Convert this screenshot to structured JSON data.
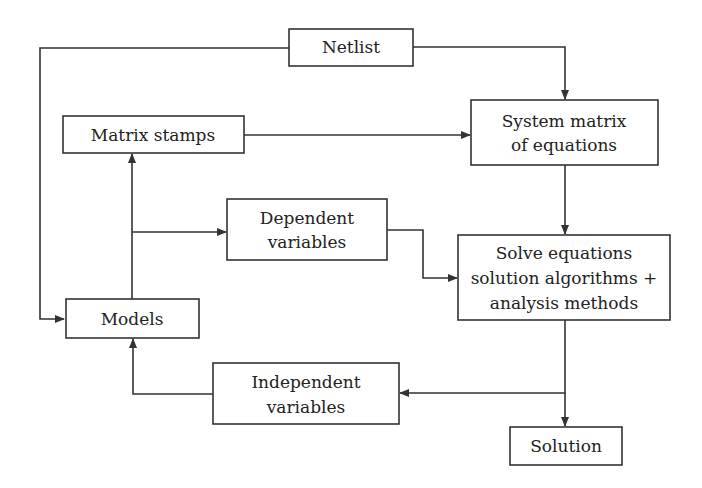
{
  "diagram": {
    "nodes": [
      {
        "id": "netlist",
        "lines": [
          "Netlist"
        ]
      },
      {
        "id": "matrix-stamps",
        "lines": [
          "Matrix stamps"
        ]
      },
      {
        "id": "system-matrix",
        "lines": [
          "System matrix",
          "of equations"
        ]
      },
      {
        "id": "dependent-variables",
        "lines": [
          "Dependent",
          "variables"
        ]
      },
      {
        "id": "solve-equations",
        "lines": [
          "Solve equations",
          "solution algorithms +",
          "analysis methods"
        ]
      },
      {
        "id": "models",
        "lines": [
          "Models"
        ]
      },
      {
        "id": "independent-variables",
        "lines": [
          "Independent",
          "variables"
        ]
      },
      {
        "id": "solution",
        "lines": [
          "Solution"
        ]
      }
    ],
    "edges": [
      {
        "from": "netlist",
        "to": "models"
      },
      {
        "from": "netlist",
        "to": "system-matrix"
      },
      {
        "from": "matrix-stamps",
        "to": "system-matrix"
      },
      {
        "from": "system-matrix",
        "to": "solve-equations"
      },
      {
        "from": "models",
        "to": "matrix-stamps"
      },
      {
        "from": "models",
        "to": "dependent-variables"
      },
      {
        "from": "dependent-variables",
        "to": "solve-equations"
      },
      {
        "from": "solve-equations",
        "to": "independent-variables"
      },
      {
        "from": "solve-equations",
        "to": "solution"
      },
      {
        "from": "independent-variables",
        "to": "models"
      }
    ]
  }
}
